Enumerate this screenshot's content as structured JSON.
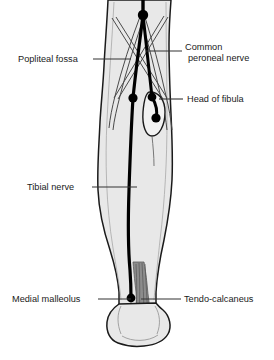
{
  "figure": {
    "view": "posterior-right-leg",
    "background_color": "#ffffff",
    "skin_fill": "#e8e8e8",
    "outline_color": "#1a1a1a",
    "nerve_color": "#000000",
    "tendon_color": "#6e6e6e",
    "leader_color": "#333333",
    "label_color": "#1a1a1a"
  },
  "labels": {
    "popliteal_fossa": {
      "text": "Popliteal fossa",
      "side": "left",
      "text_x": 18,
      "text_y": 62,
      "leader_from_x": 93,
      "leader_from_y": 59,
      "leader_to_x": 131,
      "leader_to_y": 59
    },
    "common_peroneal_nerve": {
      "line1": "Common",
      "line2": "peroneal nerve",
      "side": "right",
      "text_x": 185,
      "text_y": 54,
      "line_gap": 11,
      "leader_from_x": 182,
      "leader_from_y": 51,
      "leader_to_x": 146,
      "leader_to_y": 51
    },
    "head_of_fibula": {
      "text": "Head of fibula",
      "side": "right",
      "text_x": 187,
      "text_y": 102,
      "leader_from_x": 183,
      "leader_from_y": 99,
      "leader_to_x": 159,
      "leader_to_y": 99
    },
    "tibial_nerve": {
      "text": "Tibial nerve",
      "side": "left",
      "text_x": 27,
      "text_y": 190,
      "leader_from_x": 92,
      "leader_from_y": 187,
      "leader_to_x": 137,
      "leader_to_y": 187
    },
    "medial_malleolus": {
      "text": "Medial malleolus",
      "side": "left",
      "text_x": 12,
      "text_y": 302,
      "leader_from_x": 98,
      "leader_from_y": 299,
      "leader_to_x": 131,
      "leader_to_y": 299
    },
    "tendo_calcaneus": {
      "text": "Tendo-calcaneus",
      "side": "right",
      "text_x": 184,
      "text_y": 302,
      "leader_from_x": 181,
      "leader_from_y": 299,
      "leader_to_x": 141,
      "leader_to_y": 299
    }
  },
  "structures": {
    "leg_silhouette": "posterior leg from mid-thigh to heel",
    "popliteal_fossa_outline": "diamond formed by hamstring and gastrocnemius borders",
    "fibula_head_outline": "elongated oval lateral to knee",
    "tibial_nerve_path": "descends from popliteal fossa midline to medial malleolus",
    "common_peroneal_nerve_path": "passes laterally from popliteal fossa around neck of fibula",
    "tendo_calcaneus_shape": "striated tendon inserting onto calcaneus",
    "calcaneus_outline": "heel bone at base"
  },
  "markers": {
    "popliteal_apex_node": {
      "x": 143,
      "y": 15,
      "r": 5.2
    },
    "tibial_branch_node": {
      "x": 133,
      "y": 98,
      "r": 4.6
    },
    "peroneal_fibula_neck_node": {
      "x": 152,
      "y": 97,
      "r": 4.4
    },
    "peroneal_terminal_node": {
      "x": 156,
      "y": 118,
      "r": 4.6
    },
    "medial_malleolus_node": {
      "x": 131,
      "y": 298,
      "r": 4.4
    }
  }
}
